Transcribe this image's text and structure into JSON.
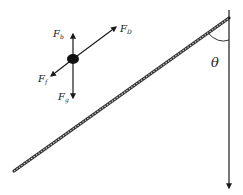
{
  "diagram": {
    "type": "free-body diagram with rope on incline",
    "colors": {
      "line": "#1a1a1a",
      "rope_dark": "#333333",
      "rope_light": "#bbbbbb",
      "text": "#222222",
      "background": "#ffffff"
    },
    "body": {
      "shape": "filled ellipse",
      "center": [
        73,
        59
      ]
    },
    "forces": [
      {
        "id": "Fb",
        "symbol": "F",
        "subscript": "b",
        "direction": "up"
      },
      {
        "id": "FD",
        "symbol": "F",
        "subscript": "D",
        "direction": "up-right (along rope)"
      },
      {
        "id": "Ff",
        "symbol": "F",
        "subscript": "f",
        "direction": "down-left (along rope)"
      },
      {
        "id": "Fg",
        "symbol": "F",
        "subscript": "g",
        "direction": "down"
      }
    ],
    "angle": {
      "symbol": "θ",
      "between": "rope and vertical line"
    },
    "rope": {
      "start": [
        14,
        171
      ],
      "end": [
        229,
        18
      ]
    },
    "vertical_line": {
      "x": 229,
      "top": 10,
      "bottom": 190,
      "arrow": "down"
    }
  }
}
